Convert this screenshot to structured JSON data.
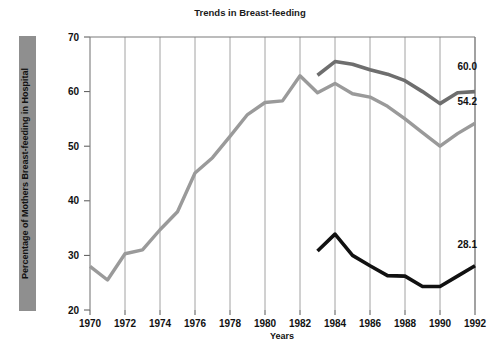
{
  "chart_data": {
    "type": "line",
    "title": "Trends in Breast-feeding",
    "xlabel": "Years",
    "ylabel": "Percentage of Mothers Breast-feeding in Hospital",
    "xlim": [
      1970,
      1992
    ],
    "ylim": [
      20,
      70
    ],
    "xticks": [
      1970,
      1972,
      1974,
      1976,
      1978,
      1980,
      1982,
      1984,
      1986,
      1988,
      1990,
      1992
    ],
    "yticks": [
      20,
      30,
      40,
      50,
      60,
      70
    ],
    "xtick_labels": [
      "1970",
      "1972",
      "1974",
      "1976",
      "1978",
      "1980",
      "1982",
      "1984",
      "1986",
      "1988",
      "1990",
      "1992"
    ],
    "ytick_labels": [
      "20",
      "30",
      "40",
      "50",
      "60",
      "70"
    ],
    "grid": "vertical",
    "legend": "none",
    "series": [
      {
        "name": "all-mothers",
        "color": "#9a9a9a",
        "width": 3.4,
        "end_label": "54.2",
        "x": [
          1970,
          1971,
          1972,
          1973,
          1974,
          1975,
          1976,
          1977,
          1978,
          1979,
          1980,
          1981,
          1982,
          1983,
          1984,
          1985,
          1986,
          1987,
          1988,
          1989,
          1990,
          1991,
          1992
        ],
        "values": [
          28.0,
          25.5,
          30.3,
          31.0,
          34.7,
          38.0,
          45.1,
          47.9,
          51.8,
          55.8,
          58.0,
          58.3,
          62.9,
          59.8,
          61.5,
          59.6,
          59.0,
          57.3,
          55.0,
          52.5,
          50.0,
          52.3,
          54.2
        ]
      },
      {
        "name": "upper-group",
        "color": "#6e6e6e",
        "width": 3.6,
        "end_label": "60.0",
        "x": [
          1983,
          1984,
          1985,
          1986,
          1987,
          1988,
          1989,
          1990,
          1991,
          1992
        ],
        "values": [
          63.0,
          65.5,
          65.0,
          64.0,
          63.2,
          62.0,
          60.0,
          57.8,
          59.8,
          60.0
        ]
      },
      {
        "name": "lower-group",
        "color": "#111111",
        "width": 3.6,
        "end_label": "28.1",
        "x": [
          1983,
          1984,
          1985,
          1986,
          1987,
          1988,
          1989,
          1990,
          1991,
          1992
        ],
        "values": [
          30.8,
          33.9,
          30.0,
          28.1,
          26.3,
          26.2,
          24.3,
          24.3,
          26.2,
          28.1
        ]
      }
    ],
    "value_labels": [
      {
        "name": "label-upper",
        "text": "60.0",
        "x": 1991.0,
        "y": 64.0
      },
      {
        "name": "label-middle",
        "text": "54.2",
        "x": 1991.0,
        "y": 57.6
      },
      {
        "name": "label-lower",
        "text": "28.1",
        "x": 1991.0,
        "y": 31.4
      }
    ]
  }
}
